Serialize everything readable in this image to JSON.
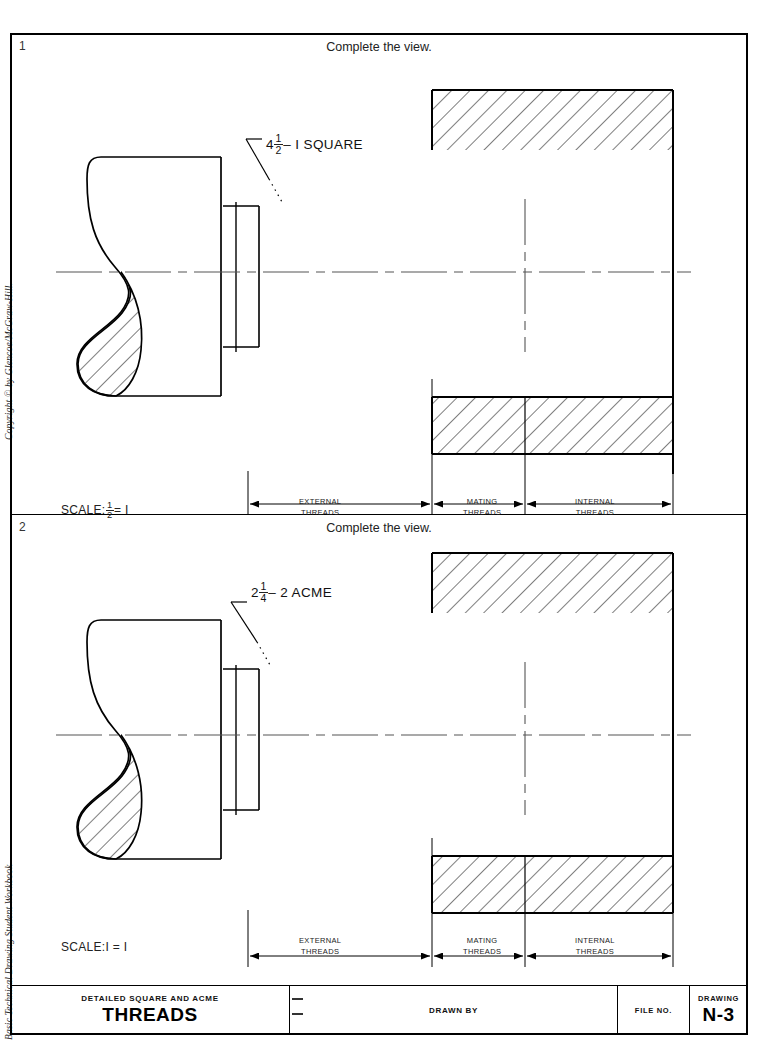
{
  "sheet": {
    "margin": {
      "copyright": "Copyright © by Glencoe/McGraw-Hill.",
      "book": "Basic Technical Drawing Student Workbook"
    }
  },
  "panels": [
    {
      "number": "1",
      "instruction": "Complete the view.",
      "thread_label": {
        "whole": "4",
        "num": "1",
        "den": "2",
        "suffix": "– I  SQUARE"
      },
      "scale": {
        "prefix": "SCALE:",
        "num": "1",
        "den": "2",
        "suffix": "= I"
      },
      "dimensions": [
        {
          "line1": "EXTERNAL",
          "line2": "THREADS"
        },
        {
          "line1": "MATING",
          "line2": "THREADS"
        },
        {
          "line1": "INTERNAL",
          "line2": "THREADS"
        }
      ]
    },
    {
      "number": "2",
      "instruction": "Complete the view.",
      "thread_label": {
        "whole": "2",
        "num": "1",
        "den": "4",
        "suffix": "– 2  ACME"
      },
      "scale": {
        "prefix": "SCALE:",
        "num": "",
        "den": "",
        "plain": "I = I"
      },
      "dimensions": [
        {
          "line1": "EXTERNAL",
          "line2": "THREADS"
        },
        {
          "line1": "MATING",
          "line2": "THREADS"
        },
        {
          "line1": "INTERNAL",
          "line2": "THREADS"
        }
      ]
    }
  ],
  "titleblock": {
    "subject_sub": "DETAILED SQUARE AND ACME",
    "subject_main": "THREADS",
    "drawn_by": "DRAWN BY",
    "file_no": "FILE NO.",
    "drawing_label": "DRAWING",
    "drawing_no": "N-3"
  },
  "colors": {
    "ink": "#000000",
    "paper": "#ffffff",
    "centerline": "#555555"
  }
}
